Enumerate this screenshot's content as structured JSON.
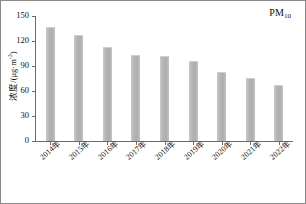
{
  "chart_data": {
    "type": "bar",
    "title": "",
    "annotation": "PM10",
    "annotation_base": "PM",
    "annotation_sub": "10",
    "categories": [
      "2014年",
      "2015年",
      "2016年",
      "2017年",
      "2018年",
      "2019年",
      "2020年",
      "2021年",
      "2022年"
    ],
    "values": [
      137,
      127,
      113,
      103,
      102,
      96,
      83,
      76,
      67
    ],
    "xlabel": "",
    "ylabel": "浓度/(μg·m⁻³)",
    "ylabel_base": "浓度/(μg·m",
    "ylabel_sup": "-3",
    "ylabel_tail": ")",
    "ylim": [
      0,
      150
    ],
    "yticks": [
      0,
      30,
      60,
      90,
      120,
      150
    ],
    "ytick_labels": [
      "0",
      "30",
      "60",
      "90",
      "120",
      "150"
    ],
    "grid": false,
    "legend": "none",
    "bar_color": "#b4b4b4",
    "axis_color": "#6b6b6b",
    "frame_color": "#8a8a8a",
    "text_color": "#111111"
  }
}
